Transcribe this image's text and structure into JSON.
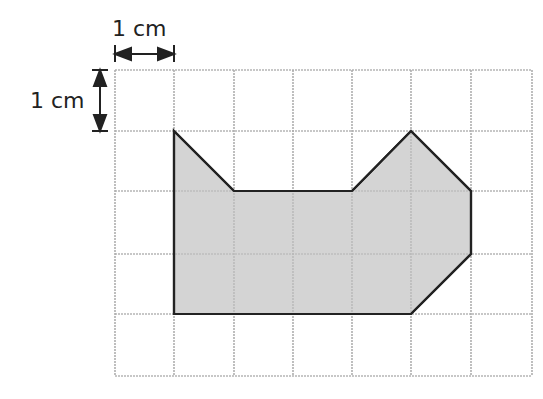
{
  "labels": {
    "horizontal_scale": "1 cm",
    "vertical_scale": "1 cm"
  },
  "grid": {
    "columns": 7,
    "rows": 5,
    "x_lines": [
      115,
      174,
      234,
      293,
      352,
      411,
      471,
      532
    ],
    "y_lines": [
      70,
      131,
      191,
      254,
      314,
      376
    ],
    "line_color": "#aaaaaa"
  },
  "shape": {
    "fill": "#cccccc",
    "stroke": "#222222",
    "vertices_grid_units": [
      [
        1,
        1
      ],
      [
        2,
        2
      ],
      [
        4,
        2
      ],
      [
        5,
        1
      ],
      [
        6,
        2
      ],
      [
        6,
        3
      ],
      [
        5,
        4
      ],
      [
        1,
        4
      ]
    ]
  }
}
